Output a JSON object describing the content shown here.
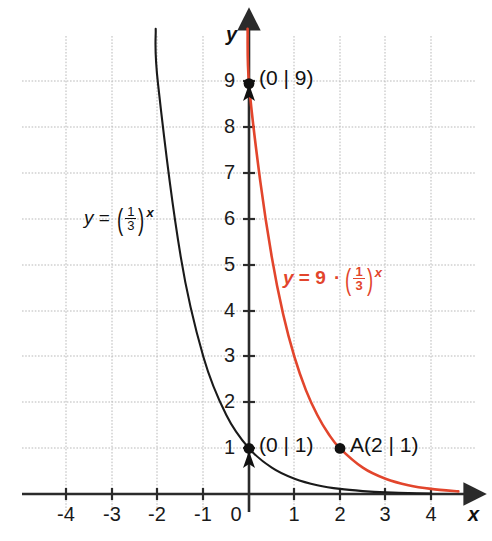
{
  "chart_data": {
    "type": "line",
    "title": "",
    "xlabel": "x",
    "ylabel": "y",
    "xlim": [
      -4.6,
      4.8
    ],
    "ylim": [
      -0.6,
      9.9
    ],
    "grid": true,
    "grid_spacing": 1,
    "legend": "inline-annotations",
    "xticks": [
      "-4",
      "-3",
      "-2",
      "-1",
      "0",
      "1",
      "2",
      "3",
      "4"
    ],
    "xtick_values": [
      -4,
      -3,
      -2,
      -1,
      0,
      1,
      2,
      3,
      4
    ],
    "yticks": [
      "1",
      "2",
      "3",
      "4",
      "5",
      "6",
      "7",
      "8",
      "9"
    ],
    "ytick_values": [
      1,
      2,
      3,
      4,
      5,
      6,
      7,
      8,
      9
    ],
    "series": [
      {
        "name": "y = (1/3)^x",
        "color": "#1a1a1a",
        "formula_parts": {
          "lhs": "y",
          "equals": "=",
          "numerator": "1",
          "denominator": "3",
          "exponent": "x"
        },
        "points": [
          {
            "x": -2.05,
            "y": 10.2
          },
          {
            "x": -2,
            "y": 9
          },
          {
            "x": -1.5,
            "y": 5.196
          },
          {
            "x": -1,
            "y": 3
          },
          {
            "x": -0.5,
            "y": 1.732
          },
          {
            "x": 0,
            "y": 1
          },
          {
            "x": 0.5,
            "y": 0.577
          },
          {
            "x": 1,
            "y": 0.333
          },
          {
            "x": 1.5,
            "y": 0.192
          },
          {
            "x": 2,
            "y": 0.111
          },
          {
            "x": 2.5,
            "y": 0.064
          },
          {
            "x": 3,
            "y": 0.037
          },
          {
            "x": 3.5,
            "y": 0.021
          },
          {
            "x": 4,
            "y": 0.012
          }
        ]
      },
      {
        "name": "y = 9 · (1/3)^x",
        "color": "#e2452c",
        "formula_parts": {
          "lhs": "y",
          "equals": "=",
          "coefficient": "9",
          "dot": "·",
          "numerator": "1",
          "denominator": "3",
          "exponent": "x"
        },
        "points": [
          {
            "x": -0.03,
            "y": 10.2
          },
          {
            "x": 0,
            "y": 9
          },
          {
            "x": 0.25,
            "y": 6.838
          },
          {
            "x": 0.5,
            "y": 5.196
          },
          {
            "x": 0.75,
            "y": 3.948
          },
          {
            "x": 1,
            "y": 3
          },
          {
            "x": 1.25,
            "y": 2.279
          },
          {
            "x": 1.5,
            "y": 1.732
          },
          {
            "x": 1.75,
            "y": 1.316
          },
          {
            "x": 2,
            "y": 1
          },
          {
            "x": 2.5,
            "y": 0.577
          },
          {
            "x": 3,
            "y": 0.333
          },
          {
            "x": 3.5,
            "y": 0.192
          },
          {
            "x": 4,
            "y": 0.111
          },
          {
            "x": 4.6,
            "y": 0.057
          }
        ]
      }
    ],
    "marked_points": [
      {
        "label": "(0 | 9)",
        "x": 0,
        "y": 9,
        "series": "red"
      },
      {
        "label": "(0 | 1)",
        "x": 0,
        "y": 1,
        "series": "black"
      },
      {
        "label": "A(2 | 1)",
        "x": 2,
        "y": 1,
        "series": "red"
      }
    ],
    "colors": {
      "background": "#ffffff",
      "grid": "#b9b9b9",
      "axis": "#2b2b2b",
      "curve_black": "#1a1a1a",
      "curve_red": "#e2452c",
      "text": "#111111"
    }
  },
  "axis": {
    "x_name": "x",
    "y_name": "y",
    "x_tick_labels": [
      "-4",
      "-3",
      "-2",
      "-1",
      "0",
      "1",
      "2",
      "3",
      "4"
    ],
    "y_tick_labels": [
      "9",
      "8",
      "7",
      "6",
      "5",
      "4",
      "3",
      "2",
      "1"
    ]
  },
  "annotations": {
    "black_formula": {
      "lhs": "y",
      "equals": "=",
      "numerator": "1",
      "denominator": "3",
      "exponent": "x"
    },
    "red_formula": {
      "lhs": "y",
      "equals": "=",
      "coefficient": "9",
      "dot": "·",
      "numerator": "1",
      "denominator": "3",
      "exponent": "x"
    },
    "point_top": "(0 | 9)",
    "point_origin": "(0 | 1)",
    "point_a": "A(2 | 1)"
  }
}
